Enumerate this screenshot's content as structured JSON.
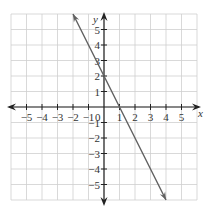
{
  "chart_data": {
    "type": "line",
    "title": "",
    "xlabel": "x",
    "ylabel": "y",
    "xlim": [
      -6,
      6
    ],
    "ylim": [
      -6,
      6
    ],
    "grid": true,
    "x_ticks": [
      -5,
      -4,
      -3,
      -2,
      -1,
      1,
      2,
      3,
      4,
      5
    ],
    "y_ticks": [
      5,
      4,
      3,
      2,
      1,
      -1,
      -2,
      -3,
      -4,
      -5
    ],
    "origin_label": "0",
    "series": [
      {
        "name": "line",
        "equation": "y = -2x + 2",
        "slope": -2,
        "intercept": 2,
        "x": [
          -2,
          -1,
          0,
          1,
          2,
          3,
          4
        ],
        "y": [
          6,
          4,
          2,
          0,
          -2,
          -4,
          -6
        ],
        "arrows": "both"
      }
    ]
  },
  "colors": {
    "grid": "#cfcfcf",
    "axes": "#222222",
    "line": "#606060",
    "text": "#333333"
  }
}
